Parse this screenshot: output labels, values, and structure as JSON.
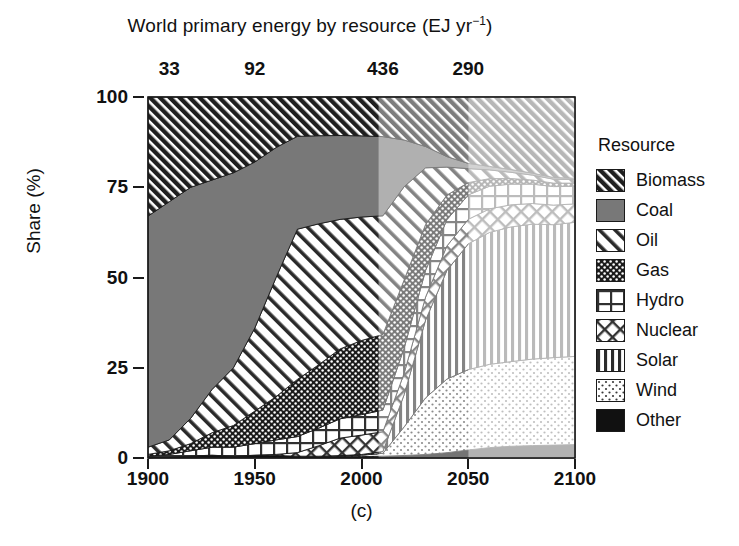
{
  "chart_data": {
    "type": "area",
    "title": "World primary energy by resource (EJ yr−1)",
    "title_main": "World primary energy by resource (EJ yr",
    "title_sup": "−1",
    "title_tail": ")",
    "caption": "(c)",
    "xlabel": "",
    "ylabel": "Share (%)",
    "xlim": [
      1900,
      2100
    ],
    "ylim": [
      0,
      100
    ],
    "grid": false,
    "stacked": true,
    "stack_order_bottom_to_top": [
      "Other",
      "Wind",
      "Solar",
      "Nuclear",
      "Hydro",
      "Gas",
      "Oil",
      "Coal",
      "Biomass"
    ],
    "xticks": [
      1900,
      1950,
      2000,
      2050,
      2100
    ],
    "xtick_labels": [
      "1900",
      "1950",
      "2000",
      "2050",
      "2100"
    ],
    "yticks": [
      0,
      25,
      50,
      75,
      100
    ],
    "ytick_labels": [
      "0",
      "25",
      "50",
      "75",
      "100"
    ],
    "secondary_axis": {
      "label": "total primary energy (EJ yr−1)",
      "ticks": [
        1910,
        1950,
        2010,
        2050
      ],
      "tick_labels": [
        "33",
        "92",
        "436",
        "290"
      ]
    },
    "shading_periods": [
      {
        "from": 1900,
        "to": 2008,
        "shade": "historical"
      },
      {
        "from": 2008,
        "to": 2050,
        "shade": "projection-near"
      },
      {
        "from": 2050,
        "to": 2100,
        "shade": "projection-far"
      }
    ],
    "x": [
      1900,
      1910,
      1920,
      1930,
      1940,
      1950,
      1960,
      1970,
      1980,
      1990,
      2000,
      2010,
      2020,
      2030,
      2040,
      2050,
      2060,
      2070,
      2080,
      2090,
      2100
    ],
    "series": [
      {
        "name": "Biomass",
        "pattern": "diagonal-hatch-dark",
        "values": [
          33,
          29,
          25,
          23,
          21,
          18,
          14,
          11,
          11,
          11,
          11,
          11,
          12,
          14,
          17,
          19,
          20,
          21,
          22,
          23,
          23
        ]
      },
      {
        "name": "Coal",
        "pattern": "solid-gray",
        "values": [
          64,
          66,
          64,
          58,
          54,
          46,
          36,
          26,
          25,
          24,
          23,
          22,
          13,
          6,
          3,
          1.5,
          1,
          0.8,
          0.6,
          0.5,
          0.4
        ]
      },
      {
        "name": "Oil",
        "pattern": "diagonal-hatch-wide",
        "values": [
          2,
          3,
          7,
          12,
          16,
          23,
          33,
          42,
          40,
          37,
          35,
          33,
          26,
          16,
          8,
          4,
          2.5,
          1.8,
          1.4,
          1.1,
          1
        ]
      },
      {
        "name": "Gas",
        "pattern": "dot-grid-dark",
        "values": [
          0.5,
          1,
          2,
          4,
          6,
          9,
          12,
          16,
          18,
          20,
          21,
          21,
          19,
          13,
          7,
          3.5,
          2.2,
          1.6,
          1.2,
          1,
          0.9
        ]
      },
      {
        "name": "Hydro",
        "pattern": "grid",
        "values": [
          0.4,
          0.8,
          1.5,
          2.2,
          2.6,
          3.2,
          4,
          4.5,
          5,
          5.5,
          5.8,
          6,
          7,
          7.5,
          7.5,
          7,
          6.5,
          6,
          5.6,
          5.3,
          5
        ]
      },
      {
        "name": "Nuclear",
        "pattern": "diamond-crosshatch",
        "values": [
          0,
          0,
          0,
          0,
          0,
          0,
          0.3,
          1,
          3,
          5,
          5.5,
          5.5,
          6,
          6.5,
          7,
          7,
          6.8,
          6.4,
          6,
          5.6,
          5.2
        ]
      },
      {
        "name": "Solar",
        "pattern": "vertical-lines",
        "values": [
          0,
          0,
          0,
          0,
          0,
          0,
          0,
          0,
          0,
          0.1,
          0.2,
          0.5,
          9,
          22,
          31,
          36,
          38,
          39,
          39,
          38,
          38
        ]
      },
      {
        "name": "Wind",
        "pattern": "light-dots",
        "values": [
          0,
          0,
          0,
          0,
          0,
          0,
          0,
          0,
          0.1,
          0.2,
          0.4,
          0.8,
          8,
          16,
          21,
          23,
          24,
          24.5,
          25,
          25,
          25
        ]
      },
      {
        "name": "Other",
        "pattern": "solid-black",
        "values": [
          0.1,
          0.2,
          0.5,
          0.8,
          0.4,
          0.8,
          0.7,
          0.5,
          0.4,
          0.4,
          0.4,
          0.5,
          0.7,
          1,
          1.5,
          2.3,
          3,
          3.4,
          3.6,
          3.7,
          3.8
        ]
      }
    ],
    "legend": {
      "position": "right",
      "title": "Resource",
      "entries": [
        {
          "label": "Biomass",
          "pattern": "diagonal-hatch-dark"
        },
        {
          "label": "Coal",
          "pattern": "solid-gray"
        },
        {
          "label": "Oil",
          "pattern": "diagonal-hatch-wide"
        },
        {
          "label": "Gas",
          "pattern": "dot-grid-dark"
        },
        {
          "label": "Hydro",
          "pattern": "grid"
        },
        {
          "label": "Nuclear",
          "pattern": "diamond-crosshatch"
        },
        {
          "label": "Solar",
          "pattern": "vertical-lines"
        },
        {
          "label": "Wind",
          "pattern": "light-dots"
        },
        {
          "label": "Other",
          "pattern": "solid-black"
        }
      ]
    },
    "colors": {
      "ink": "#1a1a1a",
      "coal_gray": "#7a7a7a",
      "background": "#ffffff",
      "fade_near": "rgba(255,255,255,0.42)",
      "fade_far": "rgba(255,255,255,0.68)"
    }
  }
}
